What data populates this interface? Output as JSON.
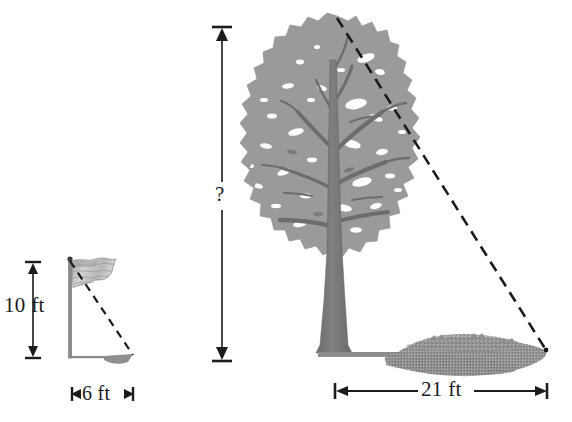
{
  "figure": {
    "background_color": "#ffffff",
    "ink_color": "#1b1b1b",
    "foliage_color": "#9a9a9a",
    "trunk_color": "#787878",
    "shadow_color": "#8e8e8e",
    "flag_color": "#c9c9c9"
  },
  "labels": {
    "flagpole_height": "10 ft",
    "flagpole_shadow_length": "6 ft",
    "tree_height": "?",
    "tree_shadow_length": "21 ft"
  },
  "objects": {
    "flag": {
      "name": "flag on pole",
      "pole_top": "(70, 259)",
      "pole_base": "(70, 358)"
    },
    "tree": {
      "name": "deciduous tree",
      "crown_top": "(337, 16)",
      "trunk_base": "(332, 353)"
    },
    "sun_ray_flag": {
      "name": "dashed sight line from flag top to shadow tip",
      "from": "(70, 259)",
      "to": "(133, 355)"
    },
    "sun_ray_tree": {
      "name": "dashed sight line from tree top to shadow tip",
      "from": "(337, 18)",
      "to": "(546, 350)"
    }
  },
  "icons": {
    "arrow_up": "arrow-up-icon",
    "arrow_down": "arrow-down-icon",
    "arrow_left": "arrow-left-icon",
    "arrow_right": "arrow-right-icon"
  }
}
